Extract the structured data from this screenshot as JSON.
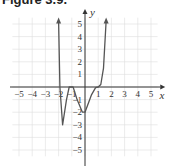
{
  "figure": {
    "title": "Figure 3.9."
  },
  "chart_data": {
    "type": "line",
    "title": "Figure 3.9.",
    "xlabel": "x",
    "ylabel": "y",
    "xlim": [
      -5.5,
      5.5
    ],
    "ylim": [
      -5.5,
      5.5
    ],
    "grid": true,
    "x_ticks": [
      "−5",
      "−4",
      "−3",
      "−2",
      "−1",
      "1",
      "2",
      "3",
      "4",
      "5"
    ],
    "y_ticks": [
      "5",
      "4",
      "3",
      "2",
      "1",
      "−1",
      "−2",
      "−3",
      "−4",
      "−5"
    ],
    "series": [
      {
        "name": "f(x)",
        "points": [
          [
            -2.0,
            5.2
          ],
          [
            -1.9,
            0.0
          ],
          [
            -1.7,
            -3.0
          ],
          [
            -1.4,
            -1.0
          ],
          [
            -1.2,
            0.0
          ],
          [
            -0.9,
            0.0
          ],
          [
            -0.6,
            -1.0
          ],
          [
            -0.2,
            -2.0
          ],
          [
            0.0,
            -2.0
          ],
          [
            0.5,
            -0.6
          ],
          [
            0.8,
            -0.05
          ],
          [
            1.0,
            0.0
          ],
          [
            1.2,
            0.2
          ],
          [
            1.4,
            1.5
          ],
          [
            1.6,
            5.2
          ]
        ],
        "arrows_at_ends": true,
        "color": "#555555"
      }
    ],
    "axis_color": "#333333",
    "grid_color": "#dddddd"
  }
}
